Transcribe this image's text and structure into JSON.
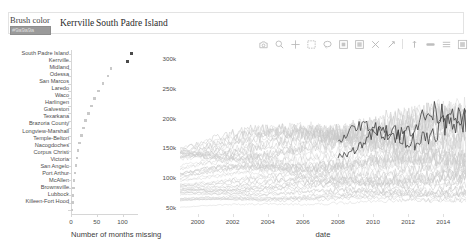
{
  "widgets": {
    "brush_color_label": "Brush color",
    "brush_color_value": "#9a9a9a",
    "brush_color_value_text": "#9a9a9a",
    "selected_cities": [
      "Kerrville",
      "South Padre Island"
    ]
  },
  "toolbar": {
    "tools": [
      {
        "name": "save-icon",
        "title": "Save"
      },
      {
        "name": "reset-icon",
        "title": "Reset"
      },
      {
        "name": "crosshair-icon",
        "title": "Crosshair"
      },
      {
        "name": "box-select-icon",
        "title": "Box Select"
      },
      {
        "name": "lasso-select-icon",
        "title": "Lasso Select"
      },
      {
        "name": "box-zoom-icon",
        "title": "Box Zoom"
      },
      {
        "name": "zoom-in-icon",
        "title": "Zoom In"
      },
      {
        "name": "zoom-out-icon",
        "title": "Zoom Out"
      },
      {
        "name": "pan-icon",
        "title": "Pan"
      },
      {
        "name": "wheel-zoom-icon",
        "title": "Wheel Zoom"
      },
      {
        "name": "tap-icon",
        "title": "Tap"
      },
      {
        "name": "hover-icon",
        "title": "Hover"
      },
      {
        "name": "bokeh-logo-icon",
        "title": "Bokeh"
      }
    ]
  },
  "chart_data": [
    {
      "type": "scatter",
      "id": "months-missing-scatter",
      "title": "",
      "xlabel": "Number of months missing",
      "ylabel": "",
      "xlim": [
        0,
        130
      ],
      "xticks": [
        0,
        50,
        100
      ],
      "xticklabels": [
        "0",
        "50",
        "100"
      ],
      "grid": false,
      "categories": [
        "South Padre Island",
        "Kerrville",
        "Midland",
        "Odessa",
        "San Marcos",
        "Laredo",
        "Waco",
        "Harlingen",
        "Galveston",
        "Texarkana",
        "Brazoria County",
        "Longview-Marshall",
        "Temple-Belton",
        "Nacogdoches",
        "Corpus Christi",
        "Victoria",
        "San Angelo",
        "Port Arthur",
        "McAllen",
        "Brownsville",
        "Lubbock",
        "Killeen-Fort Hood"
      ],
      "values": [
        118,
        110,
        78,
        72,
        62,
        54,
        46,
        40,
        34,
        28,
        24,
        20,
        17,
        14,
        12,
        10,
        8,
        6,
        5,
        4,
        3,
        2
      ],
      "selected": [
        "South Padre Island",
        "Kerrville"
      ],
      "selected_color": "#4a4a4a",
      "unselected_color": "#c9c9c9"
    },
    {
      "type": "line",
      "id": "timeseries-line",
      "title": "",
      "xlabel": "date",
      "ylabel": "",
      "xlim": [
        1999,
        2015.3
      ],
      "ylim": [
        40000,
        315000
      ],
      "xticks": [
        2000,
        2002,
        2004,
        2006,
        2008,
        2010,
        2012,
        2014
      ],
      "xticklabels": [
        "2000",
        "2002",
        "2004",
        "2006",
        "2008",
        "2010",
        "2012",
        "2014"
      ],
      "yticks": [
        50000,
        100000,
        150000,
        200000,
        250000,
        300000
      ],
      "yticklabels": [
        "50k",
        "100k",
        "150k",
        "200k",
        "250k",
        "300k"
      ],
      "grid": false,
      "legend": "none",
      "series": [
        {
          "name": "background-cities",
          "color": "#c9c9c9",
          "count": 44,
          "note": "unselected median home price series, 1999-2015"
        },
        {
          "name": "Kerrville",
          "color": "#3c3c3c",
          "note": "highlighted series, visible from 2008"
        },
        {
          "name": "South Padre Island",
          "color": "#3c3c3c",
          "note": "highlighted series, visible from 2008"
        }
      ]
    }
  ]
}
